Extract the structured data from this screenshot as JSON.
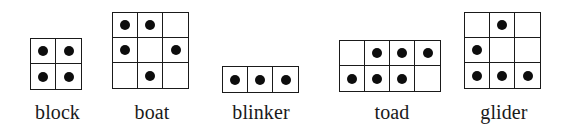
{
  "figure": {
    "background_color": "#ffffff",
    "cell_color": "#0d0d0d",
    "grid_line_color": "#1a1a1a",
    "patterns": [
      {
        "name": "block",
        "label": "block",
        "rows": 2,
        "cols": 2,
        "cells": [
          [
            1,
            1
          ],
          [
            1,
            1
          ]
        ],
        "live_count": 4,
        "x": 30,
        "y": 38,
        "label_x": 30,
        "label_width": 55,
        "label_y": 101
      },
      {
        "name": "boat",
        "label": "boat",
        "rows": 3,
        "cols": 3,
        "cells": [
          [
            1,
            1,
            0
          ],
          [
            1,
            0,
            1
          ],
          [
            0,
            1,
            0
          ]
        ],
        "live_count": 5,
        "x": 112,
        "y": 12,
        "label_x": 112,
        "label_width": 80,
        "label_y": 101
      },
      {
        "name": "blinker",
        "label": "blinker",
        "rows": 1,
        "cols": 3,
        "cells": [
          [
            1,
            1,
            1
          ]
        ],
        "live_count": 3,
        "x": 222,
        "y": 66,
        "label_x": 210,
        "label_width": 102,
        "label_y": 101
      },
      {
        "name": "toad",
        "label": "toad",
        "rows": 2,
        "cols": 4,
        "cells": [
          [
            0,
            1,
            1,
            1
          ],
          [
            1,
            1,
            1,
            0
          ]
        ],
        "live_count": 6,
        "x": 339,
        "y": 40,
        "label_x": 339,
        "label_width": 106,
        "label_y": 101
      },
      {
        "name": "glider",
        "label": "glider",
        "rows": 3,
        "cols": 3,
        "cells": [
          [
            0,
            1,
            0
          ],
          [
            1,
            0,
            0
          ],
          [
            1,
            1,
            1
          ]
        ],
        "live_count": 5,
        "x": 464,
        "y": 12,
        "label_x": 455,
        "label_width": 98,
        "label_y": 101
      }
    ]
  }
}
